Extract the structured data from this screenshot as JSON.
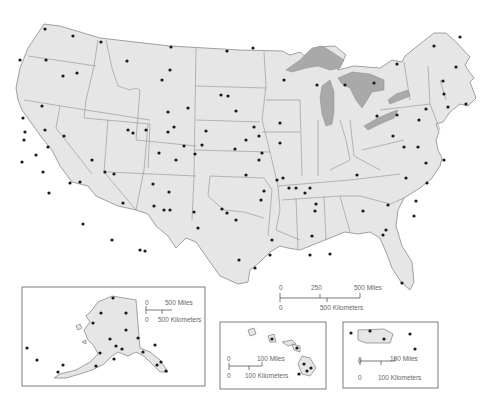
{
  "map": {
    "title": "United States outline map with state capitals",
    "colors": {
      "land": "#e6e6e6",
      "border": "#8a8a8a",
      "lakes": "#a9a9a9",
      "capital_dot": "#1a1a1a",
      "background": "#ffffff"
    },
    "main_scale": {
      "miles_labels": [
        "0",
        "250",
        "500 Miles"
      ],
      "km_labels": [
        "0",
        "500 Kilometers"
      ]
    },
    "insets": {
      "alaska": {
        "name": "Alaska",
        "scale_miles": [
          "0",
          "500 Miles"
        ],
        "scale_km": [
          "0",
          "500 Kilometers"
        ]
      },
      "hawaii": {
        "name": "Hawaii",
        "scale_miles": [
          "0",
          "100 Miles"
        ],
        "scale_km": [
          "0",
          "100 Kilometers"
        ]
      },
      "puerto_rico": {
        "name": "Puerto Rico",
        "scale_miles": [
          "0",
          "100 Miles"
        ],
        "scale_km": [
          "0",
          "100 Kilometers"
        ]
      }
    },
    "capital_dots_main": [
      [
        45,
        29
      ],
      [
        73,
        36
      ],
      [
        101,
        42
      ],
      [
        171,
        47
      ],
      [
        227,
        51
      ],
      [
        253,
        48
      ],
      [
        20,
        60
      ],
      [
        46,
        60
      ],
      [
        77,
        73
      ],
      [
        127,
        61
      ],
      [
        162,
        80
      ],
      [
        221,
        95
      ],
      [
        284,
        80
      ],
      [
        317,
        85
      ],
      [
        345,
        85
      ],
      [
        374,
        83
      ],
      [
        397,
        64
      ],
      [
        434,
        46
      ],
      [
        460,
        37
      ],
      [
        456,
        67
      ],
      [
        443,
        81
      ],
      [
        444,
        94
      ],
      [
        466,
        104
      ],
      [
        448,
        107
      ],
      [
        426,
        109
      ],
      [
        419,
        120
      ],
      [
        397,
        115
      ],
      [
        377,
        116
      ],
      [
        393,
        136
      ],
      [
        404,
        147
      ],
      [
        418,
        147
      ],
      [
        426,
        163
      ],
      [
        444,
        160
      ],
      [
        427,
        183
      ],
      [
        406,
        178
      ],
      [
        416,
        201
      ],
      [
        388,
        205
      ],
      [
        363,
        211
      ],
      [
        316,
        204
      ],
      [
        305,
        193
      ],
      [
        296,
        188
      ],
      [
        289,
        188
      ],
      [
        310,
        188
      ],
      [
        277,
        180
      ],
      [
        261,
        200
      ],
      [
        259,
        160
      ],
      [
        259,
        136
      ],
      [
        262,
        153
      ],
      [
        283,
        178
      ],
      [
        280,
        143
      ],
      [
        280,
        123
      ],
      [
        254,
        127
      ],
      [
        246,
        140
      ],
      [
        246,
        175
      ],
      [
        236,
        220
      ],
      [
        227,
        213
      ],
      [
        222,
        209
      ],
      [
        194,
        212
      ],
      [
        169,
        192
      ],
      [
        153,
        184
      ],
      [
        154,
        206
      ],
      [
        176,
        160
      ],
      [
        159,
        153
      ],
      [
        146,
        130
      ],
      [
        184,
        146
      ],
      [
        202,
        145
      ],
      [
        235,
        149
      ],
      [
        168,
        112
      ],
      [
        168,
        132
      ],
      [
        206,
        131
      ],
      [
        188,
        108
      ],
      [
        174,
        127
      ],
      [
        170,
        70
      ],
      [
        228,
        96
      ],
      [
        236,
        111
      ],
      [
        195,
        154
      ],
      [
        24,
        140
      ],
      [
        22,
        162
      ],
      [
        36,
        155
      ],
      [
        48,
        147
      ],
      [
        43,
        172
      ],
      [
        49,
        193
      ],
      [
        64,
        136
      ],
      [
        70,
        183
      ],
      [
        80,
        182
      ],
      [
        83,
        224
      ],
      [
        105,
        172
      ],
      [
        114,
        174
      ],
      [
        112,
        240
      ],
      [
        123,
        203
      ],
      [
        145,
        251
      ],
      [
        140,
        250
      ],
      [
        164,
        210
      ],
      [
        128,
        130
      ],
      [
        133,
        133
      ],
      [
        42,
        106
      ],
      [
        23,
        118
      ],
      [
        45,
        130
      ],
      [
        25,
        132
      ],
      [
        63,
        76
      ],
      [
        92,
        160
      ],
      [
        264,
        191
      ],
      [
        239,
        260
      ],
      [
        198,
        228
      ],
      [
        170,
        210
      ],
      [
        315,
        211
      ],
      [
        357,
        175
      ],
      [
        386,
        230
      ],
      [
        402,
        283
      ],
      [
        414,
        216
      ],
      [
        383,
        235
      ],
      [
        330,
        254
      ],
      [
        310,
        255
      ],
      [
        270,
        255
      ],
      [
        272,
        240
      ],
      [
        312,
        236
      ],
      [
        255,
        268
      ]
    ],
    "capital_dots_alaska": [
      [
        113,
        298
      ],
      [
        101,
        313
      ],
      [
        93,
        323
      ],
      [
        126,
        313
      ],
      [
        126,
        330
      ],
      [
        138,
        338
      ],
      [
        110,
        339
      ],
      [
        116,
        346
      ],
      [
        122,
        349
      ],
      [
        100,
        353
      ],
      [
        114,
        359
      ],
      [
        155,
        345
      ],
      [
        143,
        352
      ],
      [
        161,
        362
      ],
      [
        157,
        365
      ],
      [
        166,
        371
      ],
      [
        96,
        366
      ],
      [
        63,
        365
      ],
      [
        27,
        348
      ],
      [
        37,
        360
      ],
      [
        58,
        372
      ]
    ],
    "capital_dots_hawaii": [
      [
        272,
        339
      ],
      [
        297,
        348
      ],
      [
        304,
        364
      ],
      [
        311,
        368
      ],
      [
        307,
        371
      ],
      [
        299,
        374
      ]
    ],
    "capital_dots_puerto_rico": [
      [
        351,
        333
      ],
      [
        370,
        331
      ],
      [
        384,
        339
      ],
      [
        410,
        334
      ],
      [
        415,
        349
      ]
    ]
  }
}
